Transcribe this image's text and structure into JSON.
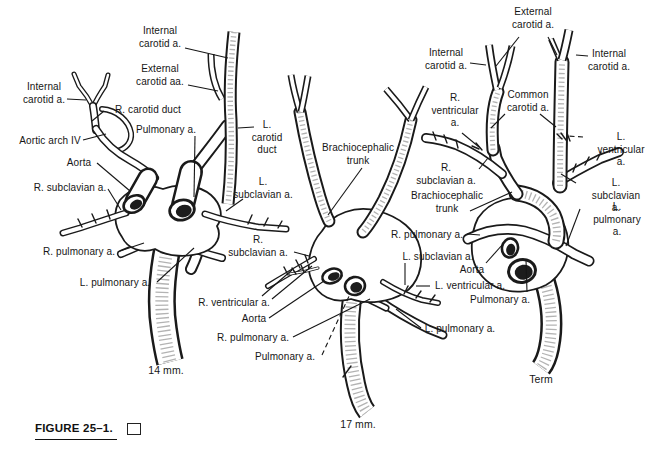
{
  "figure": {
    "caption": "FIGURE 25–1.",
    "caption_box": "empty-square"
  },
  "canvas": {
    "width": 670,
    "height": 450,
    "paper_color": "#ffffff",
    "ink_color": "#161616"
  },
  "panels": [
    {
      "name": "14 mm embryo stage",
      "caption": "14 mm.",
      "caption_pos": {
        "x": 166,
        "y": 364
      },
      "labels": [
        {
          "text": "Internal\ncarotid a.",
          "x": 160,
          "y": 25,
          "leaders": [
            [
              185,
              48,
              228,
              58
            ]
          ]
        },
        {
          "text": "External\ncarotid aa.",
          "x": 160,
          "y": 63,
          "leaders": [
            [
              188,
              85,
              218,
              91
            ]
          ]
        },
        {
          "text": "Internal\ncarotid a.",
          "x": 44,
          "y": 81,
          "leaders": [
            [
              67,
              99,
              86,
              100
            ]
          ]
        },
        {
          "text": "R. carotid duct",
          "x": 148,
          "y": 104,
          "leaders": [
            [
              104,
              111,
              92,
              121
            ]
          ]
        },
        {
          "text": "Pulmonary a.",
          "x": 166,
          "y": 124,
          "leaders": [
            [
              195,
              136,
              194,
              197
            ]
          ]
        },
        {
          "text": "Aortic arch IV",
          "x": 50,
          "y": 135,
          "leaders": [
            [
              83,
              140,
              106,
              134
            ]
          ]
        },
        {
          "text": "Aorta",
          "x": 79,
          "y": 157,
          "leaders": [
            [
              97,
              163,
              130,
              191
            ]
          ]
        },
        {
          "text": "R. subclavian a.",
          "x": 70,
          "y": 182,
          "leaders": [
            [
              108,
              189,
              121,
              210
            ]
          ]
        },
        {
          "text": "R. pulmonary a.",
          "x": 79,
          "y": 246,
          "leaders": [
            [
              120,
              251,
              144,
              243
            ]
          ]
        },
        {
          "text": "L. pulmonary a.",
          "x": 115,
          "y": 277,
          "leaders": [
            [
              157,
              282,
              194,
              248
            ]
          ]
        },
        {
          "text": "L.\ncarotid\nduct",
          "x": 267,
          "y": 119,
          "leaders": [
            [
              254,
              127,
              238,
              128
            ]
          ]
        },
        {
          "text": "L.\nsubclavian a.",
          "x": 263,
          "y": 176,
          "leaders": [
            [
              243,
              199,
              226,
              211
            ]
          ]
        },
        {
          "text": "R.\nsubclavian a.",
          "x": 258,
          "y": 234,
          "leaders": [
            [
              294,
              252,
              309,
              256
            ]
          ]
        }
      ]
    },
    {
      "name": "17 mm embryo stage",
      "caption": "17 mm.",
      "caption_pos": {
        "x": 358,
        "y": 418
      },
      "labels": [
        {
          "text": "Brachiocephalic\ntrunk",
          "x": 358,
          "y": 142,
          "leaders": [
            [
              362,
              168,
              328,
              215
            ]
          ]
        },
        {
          "text": "R. ventricular a.",
          "x": 234,
          "y": 297,
          "leaders": [
            [
              262,
              296,
              292,
              270
            ],
            [
              272,
              299,
              312,
              266
            ]
          ]
        },
        {
          "text": "Aorta",
          "x": 254,
          "y": 313,
          "leaders": [
            [
              269,
              318,
              324,
              281
            ]
          ]
        },
        {
          "text": "R. pulmonary a.",
          "x": 253,
          "y": 332,
          "leaders": [
            [
              293,
              337,
              370,
              299
            ]
          ]
        },
        {
          "text": "Pulmonary a.",
          "x": 285,
          "y": 351,
          "dashed": true,
          "leaders": [
            [
              322,
              355,
              350,
              294
            ]
          ]
        },
        {
          "text": "L. subclavian a.",
          "x": 438,
          "y": 251,
          "leaders": [
            [
              405,
              263,
              405,
              285
            ]
          ]
        },
        {
          "text": "L. ventricular a.",
          "x": 470,
          "y": 280,
          "leaders": [
            [
              430,
              286,
              416,
              286
            ]
          ]
        },
        {
          "text": "L. pulmonary a.",
          "x": 460,
          "y": 323,
          "leaders": [
            [
              421,
              328,
              396,
              309
            ]
          ]
        }
      ]
    },
    {
      "name": "Term stage",
      "caption": "Term",
      "caption_pos": {
        "x": 541,
        "y": 373
      },
      "labels": [
        {
          "text": "External\ncarotid a.",
          "x": 533,
          "y": 6,
          "leaders": [
            [
              519,
              37,
              496,
              66
            ],
            [
              548,
              37,
              557,
              55
            ]
          ]
        },
        {
          "text": "Internal\ncarotid a.",
          "x": 446,
          "y": 47,
          "leaders": [
            [
              470,
              63,
              486,
              65
            ]
          ]
        },
        {
          "text": "Internal\ncarotid a.",
          "x": 609,
          "y": 48,
          "leaders": [
            [
              588,
              56,
              576,
              55
            ]
          ]
        },
        {
          "text": "Common\ncarotid a.",
          "x": 528,
          "y": 89,
          "leaders": [
            [
              505,
              114,
              491,
              128
            ],
            [
              540,
              114,
              556,
              127
            ]
          ]
        },
        {
          "text": "R.\nventricular\na.",
          "x": 455,
          "y": 92,
          "leaders": [
            [
              462,
              133,
              479,
              147
            ]
          ]
        },
        {
          "text": "L. ventricular a.",
          "x": 621,
          "y": 131,
          "dashed": true,
          "leaders": [
            [
              583,
              137,
              568,
              136
            ]
          ]
        },
        {
          "text": "R.\nsubclavian a.",
          "x": 446,
          "y": 162,
          "leaders": [
            [
              479,
              169,
              488,
              158
            ]
          ]
        },
        {
          "text": "Brachiocephalic\ntrunk",
          "x": 447,
          "y": 190,
          "leaders": [
            [
              470,
              211,
              512,
              192
            ]
          ]
        },
        {
          "text": "L. subclavian a.",
          "x": 616,
          "y": 177,
          "leaders": [
            [
              576,
              183,
              561,
              174
            ]
          ]
        },
        {
          "text": "L. pulmonary a.",
          "x": 617,
          "y": 201,
          "leaders": [
            [
              580,
              209,
              566,
              246
            ]
          ]
        },
        {
          "text": "R. pulmonary a.",
          "x": 427,
          "y": 229,
          "leaders": [
            [
              467,
              234,
              480,
              235
            ]
          ]
        },
        {
          "text": "Aorta",
          "x": 472,
          "y": 264,
          "leaders": [
            [
              486,
              263,
              503,
              244
            ]
          ]
        },
        {
          "text": "Pulmonary a.",
          "x": 500,
          "y": 294,
          "leaders": [
            [
              527,
              292,
              526,
              260
            ]
          ]
        }
      ]
    }
  ]
}
